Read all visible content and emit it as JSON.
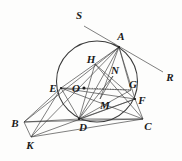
{
  "figure": {
    "type": "geometry-diagram",
    "width": 182,
    "height": 161,
    "background_color": "#fdfdfc",
    "stroke_color": "#3a3a3a",
    "label_color": "#1a1a1a"
  },
  "circle": {
    "name": "circumscribed-circle",
    "center_label": "O",
    "cx": 97,
    "cy": 81.5,
    "r": 40.5
  },
  "center_dot": {
    "cx": 84,
    "cy": 88,
    "r": 1.6
  },
  "points": [
    {
      "id": "S",
      "label": "S",
      "x": 84,
      "y": 26,
      "label_x": 79,
      "label_y": 15,
      "on_circle": false
    },
    {
      "id": "A",
      "label": "A",
      "x": 119,
      "y": 47,
      "label_x": 121,
      "label_y": 36,
      "on_circle": true
    },
    {
      "id": "R",
      "label": "R",
      "x": 163,
      "y": 72,
      "label_x": 170,
      "label_y": 77,
      "on_circle": false
    },
    {
      "id": "H",
      "label": "H",
      "x": 95,
      "y": 64,
      "label_x": 91,
      "label_y": 59,
      "on_circle": false
    },
    {
      "id": "N",
      "label": "N",
      "x": 113,
      "y": 76,
      "label_x": 115,
      "label_y": 70,
      "on_circle": false
    },
    {
      "id": "E",
      "label": "E",
      "x": 61,
      "y": 88,
      "label_x": 53,
      "label_y": 88,
      "on_circle": true
    },
    {
      "id": "O",
      "label": "O",
      "x": 84,
      "y": 88,
      "label_x": 76,
      "label_y": 88,
      "on_circle": false
    },
    {
      "id": "G",
      "label": "G",
      "x": 131,
      "y": 90,
      "label_x": 133,
      "label_y": 84,
      "on_circle": false
    },
    {
      "id": "F",
      "label": "F",
      "x": 135,
      "y": 99,
      "label_x": 142,
      "label_y": 100,
      "on_circle": true
    },
    {
      "id": "M",
      "label": "M",
      "x": 100,
      "y": 99,
      "label_x": 105,
      "label_y": 105,
      "on_circle": false
    },
    {
      "id": "B",
      "label": "B",
      "x": 24,
      "y": 122,
      "label_x": 15,
      "label_y": 123,
      "on_circle": false
    },
    {
      "id": "D",
      "label": "D",
      "x": 79,
      "y": 119,
      "label_x": 83,
      "label_y": 127,
      "on_circle": true
    },
    {
      "id": "C",
      "label": "C",
      "x": 143,
      "y": 119,
      "label_x": 148,
      "label_y": 126,
      "on_circle": false
    },
    {
      "id": "K",
      "label": "K",
      "x": 31,
      "y": 137,
      "label_x": 30,
      "label_y": 145,
      "on_circle": false
    }
  ],
  "segments": [
    {
      "name": "segment-S-R-through-A",
      "from": "S",
      "to": "R",
      "style": "solid"
    },
    {
      "name": "segment-A-E",
      "from": "A",
      "to": "E",
      "style": "solid"
    },
    {
      "name": "segment-A-D",
      "from": "A",
      "to": "D",
      "style": "solid"
    },
    {
      "name": "segment-A-M",
      "from": "A",
      "to": "M",
      "style": "solid"
    },
    {
      "name": "segment-A-F",
      "from": "A",
      "to": "F",
      "style": "solid"
    },
    {
      "name": "segment-A-G",
      "from": "A",
      "to": "G",
      "style": "solid"
    },
    {
      "name": "segment-A-K",
      "from": "A",
      "to": "K",
      "style": "solid"
    },
    {
      "name": "segment-A-B",
      "from": "A",
      "to": "B",
      "style": "solid"
    },
    {
      "name": "segment-E-F",
      "from": "E",
      "to": "F",
      "style": "solid"
    },
    {
      "name": "segment-E-D",
      "from": "E",
      "to": "D",
      "style": "solid"
    },
    {
      "name": "segment-E-C",
      "from": "E",
      "to": "C",
      "style": "solid"
    },
    {
      "name": "segment-E-K",
      "from": "E",
      "to": "K",
      "style": "solid"
    },
    {
      "name": "segment-E-B",
      "from": "E",
      "to": "B",
      "style": "solid"
    },
    {
      "name": "segment-B-C",
      "from": "B",
      "to": "C",
      "style": "solid"
    },
    {
      "name": "segment-B-D",
      "from": "B",
      "to": "D",
      "style": "solid"
    },
    {
      "name": "segment-B-K",
      "from": "B",
      "to": "K",
      "style": "solid"
    },
    {
      "name": "segment-D-C",
      "from": "D",
      "to": "C",
      "style": "solid"
    },
    {
      "name": "segment-D-F",
      "from": "D",
      "to": "F",
      "style": "solid"
    },
    {
      "name": "segment-D-G",
      "from": "D",
      "to": "G",
      "style": "solid"
    },
    {
      "name": "segment-D-N",
      "from": "D",
      "to": "N",
      "style": "solid"
    },
    {
      "name": "segment-K-C",
      "from": "K",
      "to": "C",
      "style": "solid"
    },
    {
      "name": "segment-K-F",
      "from": "K",
      "to": "F",
      "style": "solid"
    },
    {
      "name": "segment-H-F",
      "from": "H",
      "to": "F",
      "style": "solid"
    },
    {
      "name": "segment-H-C",
      "from": "H",
      "to": "C",
      "style": "solid"
    },
    {
      "name": "segment-H-D",
      "from": "H",
      "to": "D",
      "style": "solid"
    },
    {
      "name": "segment-O-G",
      "from": "O",
      "to": "G",
      "style": "dotted"
    },
    {
      "name": "segment-F-C",
      "from": "F",
      "to": "C",
      "style": "solid"
    },
    {
      "name": "segment-N-M",
      "from": "N",
      "to": "M",
      "style": "solid"
    },
    {
      "name": "segment-E-G",
      "from": "E",
      "to": "G",
      "style": "solid"
    }
  ]
}
